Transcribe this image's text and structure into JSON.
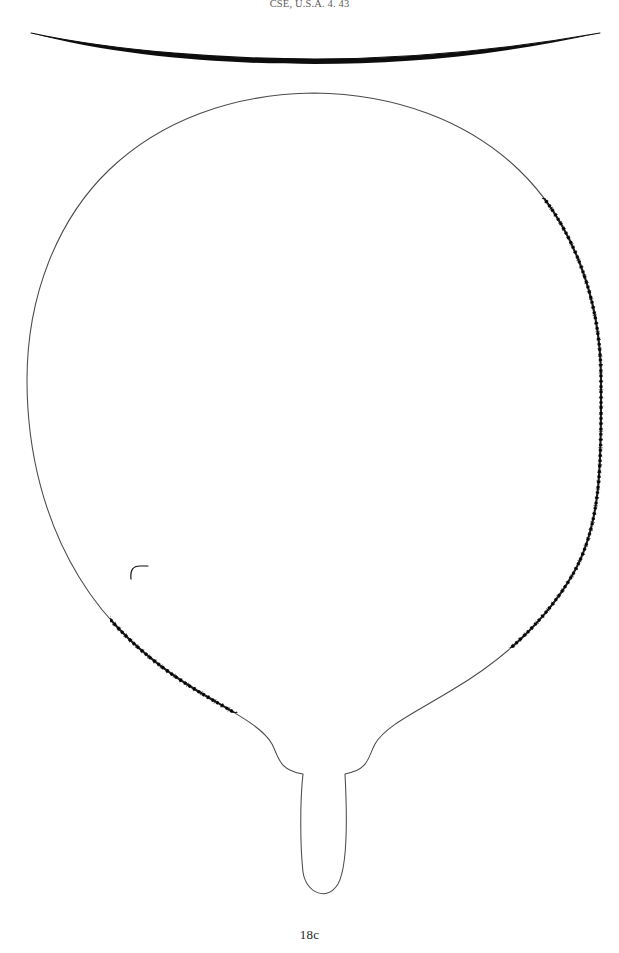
{
  "plate": {
    "width": 619,
    "height": 953,
    "background_color": "#ffffff",
    "header_citation": "CSE, U.S.A. 4. 43",
    "figure_label": "18c",
    "ink_color": "#1a1a1a",
    "thin_line_color": "#4a4a4a"
  },
  "drawing": {
    "title": "Round-bowled vessel with tapering handle",
    "profile_arc": {
      "name": "section-profile-arc",
      "description": "Shallow black arc, thickening toward both tips, spanning the full plate width above the plan view",
      "x_start": 30,
      "x_end": 601,
      "apex_y": 53,
      "tip_y": 33,
      "max_stroke": 4.2,
      "min_stroke": 0.9
    },
    "plan_view": {
      "name": "bowl-and-handle-outline",
      "bowl_center_x": 314,
      "bowl_center_y": 385,
      "bowl_radius_x": 287,
      "bowl_radius_y": 292,
      "bowl_top_y": 93,
      "bowl_left_x": 27,
      "bowl_right_x": 601,
      "handle_neck_y": 700,
      "handle_shoulder_left_x": 277,
      "handle_shoulder_right_x": 378,
      "handle_shaft_left_x": 302,
      "handle_shaft_right_x": 348,
      "handle_tip_y": 901
    },
    "edge_wear": {
      "name": "serrated-edge",
      "description": "Stippled, notched heavy line marking a worn or abraded rim",
      "right_side_from_y": 198,
      "right_side_to_y": 645,
      "left_side_from_y": 588,
      "left_side_to_y": 706,
      "notch_count_right": 78,
      "notch_count_left": 22
    },
    "marks": [
      {
        "name": "rim-notch-mark",
        "x": 137,
        "y": 570,
        "description": "Small hooked notch projecting inward from the left rim outline"
      }
    ]
  }
}
